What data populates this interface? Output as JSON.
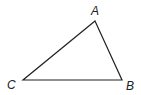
{
  "diagram": {
    "type": "triangle",
    "stroke_color": "#222222",
    "vertices": [
      {
        "name": "A",
        "x": 95,
        "y": 21,
        "label_x": 92,
        "label_y": 16
      },
      {
        "name": "B",
        "x": 122,
        "y": 80,
        "label_x": 127,
        "label_y": 90
      },
      {
        "name": "C",
        "x": 23,
        "y": 80,
        "label_x": 7,
        "label_y": 88
      }
    ],
    "labels": {
      "a": "A",
      "b": "B",
      "c": "C"
    }
  }
}
